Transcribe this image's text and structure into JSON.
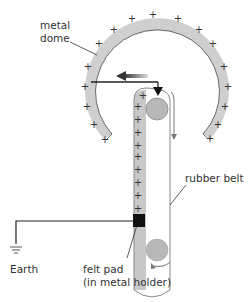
{
  "labels": {
    "metal_dome_line1": "metal",
    "metal_dome_line2": "dome",
    "rubber_belt": "rubber belt",
    "earth": "Earth",
    "felt_pad_line1": "felt pad",
    "felt_pad_line2": "(in metal holder)"
  },
  "symbols": {
    "charge": "+"
  },
  "colors": {
    "dome_fill": "#cfcfcf",
    "belt_fill": "#c8c8c8",
    "pulley_fill": "#b8b8b8",
    "line": "#222222",
    "felt_pad": "#111111"
  }
}
